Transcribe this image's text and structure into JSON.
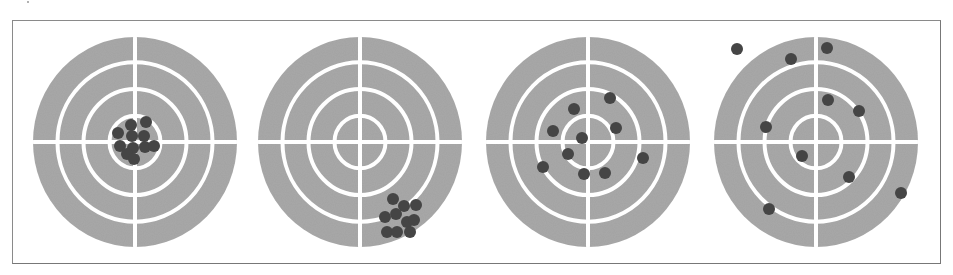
{
  "figure": {
    "colors": {
      "target_fill": "#a9a9a9",
      "ring_line": "#ffffff",
      "shot": "#454545",
      "frame": "#8a8a8a",
      "background": "#ffffff"
    },
    "target_geometry": {
      "rx": 102,
      "ry": 105,
      "ring_radii_fraction": [
        0.76,
        0.505,
        0.25
      ],
      "line_width": 4,
      "shot_radius": 6
    },
    "targets": [
      {
        "name": "accurate-precise",
        "cx": 135,
        "cy": 142,
        "shots": [
          [
            131,
            125
          ],
          [
            146,
            122
          ],
          [
            118,
            133
          ],
          [
            132,
            136
          ],
          [
            144,
            136
          ],
          [
            120,
            146
          ],
          [
            133,
            148
          ],
          [
            145,
            147
          ],
          [
            154,
            146
          ],
          [
            127,
            154
          ],
          [
            134,
            159
          ]
        ]
      },
      {
        "name": "inaccurate-precise",
        "cx": 360,
        "cy": 142,
        "shots": [
          [
            393,
            199
          ],
          [
            404,
            206
          ],
          [
            416,
            205
          ],
          [
            385,
            217
          ],
          [
            396,
            214
          ],
          [
            407,
            222
          ],
          [
            414,
            220
          ],
          [
            387,
            232
          ],
          [
            397,
            232
          ],
          [
            410,
            232
          ]
        ]
      },
      {
        "name": "accurate-imprecise",
        "cx": 588,
        "cy": 142,
        "shots": [
          [
            574,
            109
          ],
          [
            610,
            98
          ],
          [
            553,
            131
          ],
          [
            582,
            138
          ],
          [
            616,
            128
          ],
          [
            568,
            154
          ],
          [
            543,
            167
          ],
          [
            584,
            174
          ],
          [
            605,
            173
          ],
          [
            643,
            158
          ]
        ]
      },
      {
        "name": "inaccurate-imprecise",
        "cx": 816,
        "cy": 142,
        "shots": [
          [
            737,
            49
          ],
          [
            791,
            59
          ],
          [
            827,
            48
          ],
          [
            828,
            100
          ],
          [
            859,
            111
          ],
          [
            766,
            127
          ],
          [
            802,
            156
          ],
          [
            849,
            177
          ],
          [
            769,
            209
          ],
          [
            901,
            193
          ]
        ]
      }
    ]
  }
}
